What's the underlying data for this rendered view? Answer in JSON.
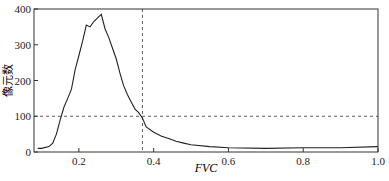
{
  "chart_data": {
    "type": "line",
    "title": "",
    "xlabel": "FVC",
    "ylabel": "像元数",
    "xlim": [
      0.08,
      1.0
    ],
    "ylim": [
      0,
      400
    ],
    "xticks": [
      "0.2",
      "0.4",
      "0.6",
      "0.8",
      "1.0"
    ],
    "yticks": [
      "0",
      "100",
      "200",
      "300",
      "400"
    ],
    "grid": false,
    "legend": null,
    "reference_lines": {
      "vertical_x": 0.37,
      "horizontal_y": 100,
      "style": "dashed"
    },
    "series": [
      {
        "name": "像元数",
        "x": [
          0.09,
          0.1,
          0.12,
          0.13,
          0.14,
          0.15,
          0.16,
          0.17,
          0.18,
          0.19,
          0.2,
          0.21,
          0.22,
          0.23,
          0.24,
          0.25,
          0.26,
          0.27,
          0.28,
          0.29,
          0.3,
          0.31,
          0.32,
          0.33,
          0.34,
          0.35,
          0.36,
          0.37,
          0.38,
          0.4,
          0.42,
          0.44,
          0.46,
          0.48,
          0.5,
          0.55,
          0.6,
          0.7,
          0.8,
          0.9,
          1.0
        ],
        "values": [
          10,
          10,
          15,
          25,
          50,
          90,
          125,
          150,
          175,
          230,
          270,
          310,
          355,
          350,
          365,
          375,
          385,
          345,
          320,
          290,
          260,
          220,
          185,
          160,
          140,
          120,
          110,
          95,
          70,
          55,
          45,
          38,
          30,
          25,
          20,
          15,
          12,
          10,
          12,
          12,
          15
        ]
      }
    ]
  }
}
